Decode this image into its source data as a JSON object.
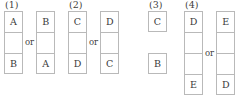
{
  "figure": {
    "type": "tile-arrangement-diagram",
    "background_color": "#ffffff",
    "border_color": "#b9b9b9",
    "text_color": "#3a3a3a",
    "or_text": "or",
    "groups": [
      {
        "label": "(1)",
        "x": 4,
        "separator": "or",
        "options": [
          {
            "style": "stacked",
            "cells": [
              "A",
              "",
              "B"
            ]
          },
          {
            "style": "stacked",
            "cells": [
              "B",
              "",
              "A"
            ]
          }
        ]
      },
      {
        "label": "(2)",
        "x": 68,
        "separator": "or",
        "options": [
          {
            "style": "stacked",
            "cells": [
              "C",
              "",
              "D"
            ]
          },
          {
            "style": "stacked",
            "cells": [
              "D",
              "",
              "C"
            ]
          }
        ]
      },
      {
        "label": "(3)",
        "x": 148,
        "separator": "",
        "options": [
          {
            "style": "separated",
            "cells": [
              "C",
              "",
              "B"
            ]
          }
        ]
      },
      {
        "label": "(4)",
        "x": 184,
        "separator": "or",
        "options": [
          {
            "style": "stacked",
            "cells": [
              "D",
              "",
              "",
              "E"
            ]
          },
          {
            "style": "stacked",
            "cells": [
              "E",
              "",
              "",
              "D"
            ]
          }
        ]
      }
    ]
  }
}
